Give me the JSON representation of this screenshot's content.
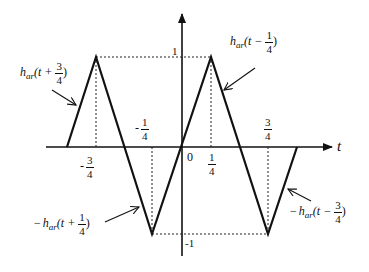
{
  "diagram": {
    "axis": {
      "x_label": "t",
      "origin_label": "0",
      "y_tick_top": "1",
      "y_tick_bottom": "-1"
    },
    "x_ticks": [
      {
        "sign": "-",
        "num": "3",
        "den": "4",
        "value": -0.75
      },
      {
        "sign": "-",
        "num": "1",
        "den": "4",
        "value": -0.25
      },
      {
        "sign": "",
        "num": "1",
        "den": "4",
        "value": 0.25
      },
      {
        "sign": "",
        "num": "3",
        "den": "4",
        "value": 0.75
      }
    ],
    "curve_labels": [
      {
        "sign": "",
        "func": "h",
        "sub": "ar",
        "arg_prefix": "(t + ",
        "num": "3",
        "den": "4",
        "arg_suffix": ")"
      },
      {
        "sign": "",
        "func": "h",
        "sub": "ar",
        "arg_prefix": "(t − ",
        "num": "1",
        "den": "4",
        "arg_suffix": ")"
      },
      {
        "sign": "−",
        "func": "h",
        "sub": "ar",
        "arg_prefix": "(t + ",
        "num": "1",
        "den": "4",
        "arg_suffix": ")"
      },
      {
        "sign": "−",
        "func": "h",
        "sub": "ar",
        "arg_prefix": "(t − ",
        "num": "3",
        "den": "4",
        "arg_suffix": ")"
      }
    ],
    "waveform_points": [
      [
        -1.0,
        0
      ],
      [
        -0.75,
        1
      ],
      [
        -0.25,
        -1
      ],
      [
        0.25,
        1
      ],
      [
        0.75,
        -1
      ],
      [
        1.0,
        0
      ]
    ],
    "colors": {
      "stroke": "#111111",
      "background": "#ffffff"
    }
  }
}
